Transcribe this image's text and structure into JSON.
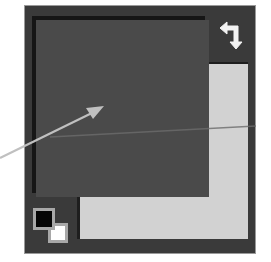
{
  "widget": {
    "name": "color-picker-swatches",
    "foreground_color": "#4a4a4a",
    "background_color": "#d2d2d2",
    "panel_color": "#3a3a3a",
    "default_foreground": "#000000",
    "default_background": "#ffffff"
  },
  "icons": {
    "swap": "swap-colors-icon",
    "default": "default-colors-icon"
  },
  "annotation": {
    "arrow_color": "#b8b8b8",
    "points_to": "foreground-swatch"
  }
}
